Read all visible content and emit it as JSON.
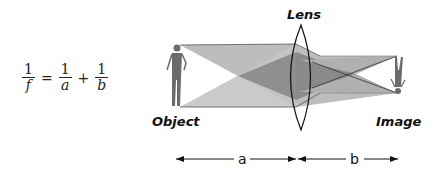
{
  "formula": {
    "lhs": {
      "numerator": "1",
      "denominator": "f"
    },
    "equals": "=",
    "term1": {
      "numerator": "1",
      "denominator": "a"
    },
    "plus": "+",
    "term2": {
      "numerator": "1",
      "denominator": "b"
    }
  },
  "labels": {
    "lens": "Lens",
    "object": "Object",
    "image": "Image"
  },
  "distances": {
    "a": "a",
    "b": "b"
  },
  "colors": {
    "beam_light": "#bdbdbd",
    "beam_medium": "#9e9e9e",
    "beam_dark": "#7a7a7a",
    "figure": "#6b6b6b",
    "line": "#111111"
  }
}
